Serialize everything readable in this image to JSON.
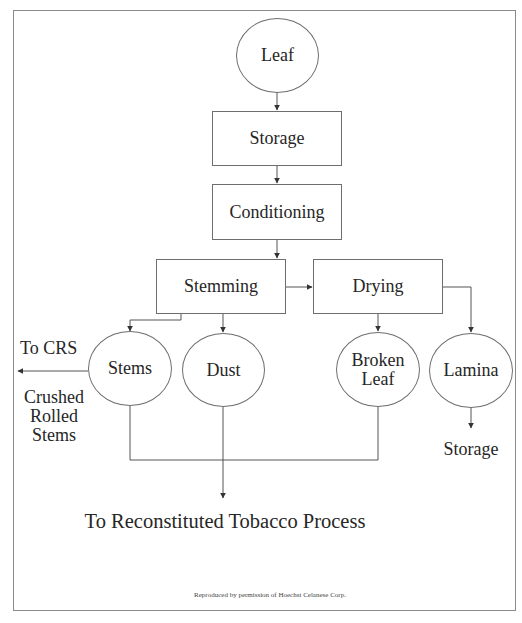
{
  "diagram": {
    "type": "process-flowchart",
    "nodes": {
      "leaf": {
        "label": "Leaf",
        "shape": "circle"
      },
      "storage": {
        "label": "Storage",
        "shape": "box"
      },
      "conditioning": {
        "label": "Conditioning",
        "shape": "box"
      },
      "stemming": {
        "label": "Stemming",
        "shape": "box"
      },
      "drying": {
        "label": "Drying",
        "shape": "box"
      },
      "stems": {
        "label": "Stems",
        "shape": "circle"
      },
      "dust": {
        "label": "Dust",
        "shape": "circle"
      },
      "broken_leaf": {
        "label_line1": "Broken",
        "label_line2": "Leaf",
        "shape": "circle"
      },
      "lamina": {
        "label": "Lamina",
        "shape": "circle"
      }
    },
    "side_labels": {
      "to_crs": "To CRS",
      "crushed_line1": "Crushed",
      "crushed_line2": "Rolled",
      "crushed_line3": "Stems",
      "lamina_storage": "Storage"
    },
    "final_output": "To Reconstituted Tobacco Process",
    "credit": "Reproduced by permission of Hoechst Celanese Corp.",
    "edges": [
      {
        "from": "Leaf",
        "to": "Storage"
      },
      {
        "from": "Storage",
        "to": "Conditioning"
      },
      {
        "from": "Conditioning",
        "to": "Stemming"
      },
      {
        "from": "Stemming",
        "to": "Drying"
      },
      {
        "from": "Stemming",
        "to": "Stems"
      },
      {
        "from": "Stemming",
        "to": "Dust"
      },
      {
        "from": "Drying",
        "to": "Broken Leaf"
      },
      {
        "from": "Drying",
        "to": "Lamina"
      },
      {
        "from": "Stems",
        "to": "To CRS (Crushed Rolled Stems)"
      },
      {
        "from": "Lamina",
        "to": "Storage"
      },
      {
        "from": "Stems",
        "to": "To Reconstituted Tobacco Process"
      },
      {
        "from": "Dust",
        "to": "To Reconstituted Tobacco Process"
      },
      {
        "from": "Broken Leaf",
        "to": "To Reconstituted Tobacco Process"
      }
    ],
    "colors": {
      "line": "#555555",
      "border": "#6e6e6e",
      "text": "#262626",
      "background": "#ffffff"
    }
  }
}
